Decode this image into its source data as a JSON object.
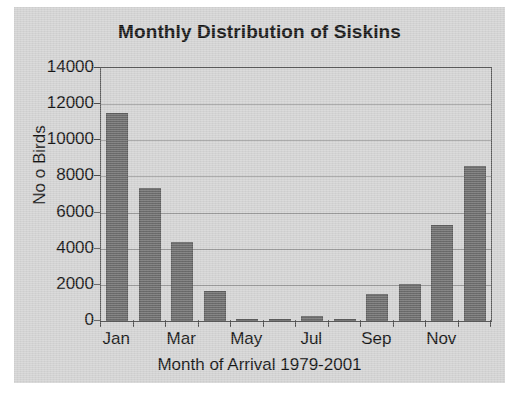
{
  "chart_data": {
    "type": "bar",
    "title": "Monthly Distribution of Siskins",
    "xlabel": "Month of Arrival 1979-2001",
    "ylabel": "No o Birds",
    "categories": [
      "Jan",
      "Feb",
      "Mar",
      "Apr",
      "May",
      "Jun",
      "Jul",
      "Aug",
      "Sep",
      "Oct",
      "Nov",
      "Dec"
    ],
    "values": [
      11500,
      7350,
      4400,
      1650,
      60,
      80,
      250,
      120,
      1500,
      2050,
      5300,
      8600
    ],
    "visible_tick_labels": [
      "Jan",
      "Mar",
      "May",
      "Jul",
      "Sep",
      "Nov"
    ],
    "ylim": [
      0,
      14000
    ],
    "ytick_values": [
      0,
      2000,
      4000,
      6000,
      8000,
      10000,
      12000,
      14000
    ],
    "ytick_labels": [
      "0",
      "2000",
      "4000",
      "6000",
      "8000",
      "10000",
      "12000",
      "14000"
    ],
    "grid": true,
    "legend": null,
    "colors": {
      "bar_fill": "#6b6b6b",
      "bar_edge": "#5c5c5c",
      "panel_background": "#d3d3d3",
      "gridline": "#9a9a9a",
      "axis": "#5a5a5a",
      "text": "#141414",
      "page_background": "#ffffff"
    }
  }
}
